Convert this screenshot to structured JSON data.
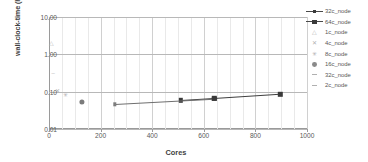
{
  "chart_data": {
    "type": "scatter",
    "title": "",
    "xlabel": "Cores",
    "ylabel": "wall-clock-time (hours)",
    "xlim": [
      0,
      1000
    ],
    "ylim": [
      0.01,
      10.0
    ],
    "yscale": "log",
    "xticks": [
      "0",
      "200",
      "400",
      "600",
      "800",
      "1000"
    ],
    "xtick_values": [
      0,
      200,
      400,
      600,
      800,
      1000
    ],
    "yticks": [
      "10.00",
      "1.00",
      "0.10",
      "0.01"
    ],
    "ytick_values": [
      10.0,
      1.0,
      0.1,
      0.01
    ],
    "grid": "major and minor vertical, major horizontal",
    "legend_position": "right",
    "series": [
      {
        "name": "32c_node",
        "marker": "square-line",
        "points": [
          [
            512,
            0.058
          ],
          [
            640,
            0.066
          ],
          [
            896,
            0.086
          ]
        ]
      },
      {
        "name": "64c_node",
        "marker": "square-line",
        "points": [
          [
            256,
            0.046
          ],
          [
            640,
            0.064
          ]
        ]
      },
      {
        "name": "1c_node",
        "marker": "triangle",
        "points": [
          [
            8,
            2.0
          ]
        ]
      },
      {
        "name": "4c_node",
        "marker": "x",
        "points": [
          [
            32,
            0.105
          ]
        ]
      },
      {
        "name": "8c_node",
        "marker": "asterisk",
        "points": [
          [
            64,
            0.082
          ]
        ]
      },
      {
        "name": "16c_node",
        "marker": "circle",
        "points": [
          [
            128,
            0.053
          ]
        ]
      },
      {
        "name": "32c_node",
        "marker": "dash",
        "points": [
          [
            16,
            0.32
          ]
        ]
      },
      {
        "name": "2c_node",
        "marker": "dash",
        "points": []
      }
    ],
    "legend_entries": [
      {
        "label": "32c_node",
        "marker": "square-line"
      },
      {
        "label": "64c_node",
        "marker": "square-line"
      },
      {
        "label": "1c_node",
        "marker": "triangle"
      },
      {
        "label": "4c_node",
        "marker": "x"
      },
      {
        "label": "8c_node",
        "marker": "asterisk"
      },
      {
        "label": "16c_node",
        "marker": "circle"
      },
      {
        "label": "32c_node",
        "marker": "dash"
      },
      {
        "label": "2c_node",
        "marker": "dash"
      }
    ]
  },
  "colors": {
    "background": "#ffffff",
    "gridline_major": "#d0d0d0",
    "gridline_minor": "#e9e9e9",
    "axis": "#9a9a9a",
    "marker_dark": "#3a3a3a",
    "marker_mid": "#7b7b7b",
    "marker_light": "#b2b2b2",
    "text": "#595959"
  }
}
